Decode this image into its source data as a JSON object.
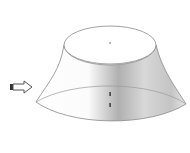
{
  "diagram": {
    "type": "frustum-3d",
    "shape": "truncated-cone",
    "colors": {
      "background": "#ffffff",
      "outline": "#8a8a8a",
      "shade_dark": "#9a9a9a",
      "shade_light": "#f4f4f4",
      "arrow_fill": "#ffffff",
      "arrow_stroke": "#555555",
      "arrow_tail": "#333333"
    },
    "arrow": {
      "icon": "right-arrow-icon",
      "direction": "right"
    },
    "top_ellipse": {
      "cx": 110,
      "cy": 45,
      "rx": 46,
      "ry": 20
    },
    "bottom_ellipse": {
      "cx": 126,
      "cy": 105,
      "rx": 90,
      "ry": 40
    },
    "marks": [
      {
        "x": 110,
        "y": 42
      },
      {
        "x": 110,
        "y": 94
      },
      {
        "x": 110,
        "y": 106
      }
    ]
  }
}
